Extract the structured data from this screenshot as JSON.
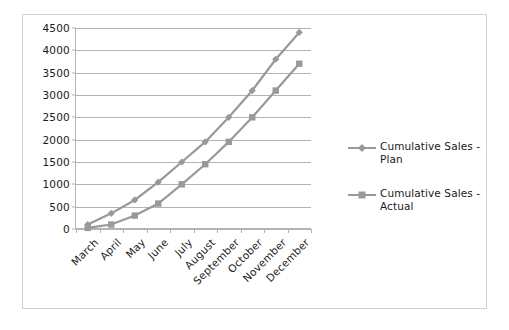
{
  "chart_data": {
    "type": "line",
    "title": "",
    "xlabel": "",
    "ylabel": "",
    "categories": [
      "March",
      "April",
      "May",
      "June",
      "July",
      "August",
      "September",
      "October",
      "November",
      "December"
    ],
    "series": [
      {
        "name": "Cumulative Sales - Plan",
        "marker": "diamond",
        "color": "#999999",
        "values": [
          100,
          350,
          650,
          1050,
          1500,
          1950,
          2500,
          3100,
          3800,
          4400
        ]
      },
      {
        "name": "Cumulative Sales - Actual",
        "marker": "square",
        "color": "#999999",
        "values": [
          25,
          100,
          300,
          570,
          1000,
          1450,
          1950,
          2500,
          3100,
          3700
        ]
      }
    ],
    "ylim": [
      0,
      4500
    ],
    "ytick_values": [
      0,
      500,
      1000,
      1500,
      2000,
      2500,
      3000,
      3500,
      4000,
      4500
    ],
    "ytick_labels": [
      "0",
      "500",
      "1000",
      "1500",
      "2000",
      "2500",
      "3000",
      "3500",
      "4000",
      "4500"
    ],
    "grid": true,
    "grid_axis": "y",
    "legend_position": "right",
    "legend_entries": [
      "Cumulative Sales - Plan",
      "Cumulative Sales - Actual"
    ],
    "colors": {
      "plan": "#999999",
      "actual": "#999999",
      "gridline": "#b3b3b3",
      "axis": "#b3b3b3",
      "border": "#d0d0d0",
      "text": "#1a1a1a",
      "background": "#ffffff"
    }
  }
}
